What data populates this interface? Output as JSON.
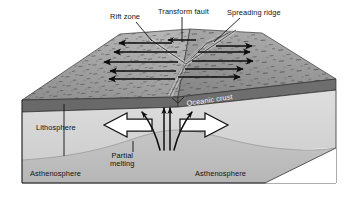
{
  "figure": {
    "type": "geological-cross-section-block-diagram",
    "width": 349,
    "height": 198,
    "background": "#ffffff"
  },
  "labels": {
    "rift_zone": "Rift zone",
    "transform_fault": "Transform fault",
    "spreading_ridge": "Spreading ridge",
    "oceanic_crust": "Oceanic crust",
    "lithosphere": "Lithosphere",
    "asthenosphere_left": "Asthenosphere",
    "asthenosphere_right": "Asthenosphere",
    "partial_melting_line1": "Partial",
    "partial_melting_line2": "melting"
  },
  "colors": {
    "background": "#ffffff",
    "top_surface_left": "#9a9a9a",
    "top_surface_right": "#8e8e8e",
    "oceanic_crust_band": "#6b6b6b",
    "crust_front_face": "#5e5e5e",
    "lithosphere_fill": "#d6d6d6",
    "asthenosphere_fill": "#c2c2c2",
    "side_face_fill": "#b9b9b9",
    "outline": "#2b2b2b",
    "arrow_solid": "#111111",
    "arrow_hollow_fill": "#ffffff",
    "label_text": "#111111",
    "label_text_on_dark": "#f2f2f2"
  },
  "features": {
    "plate_motion_arrows_left": {
      "name": "left-plate-motion-arrows",
      "direction": "west",
      "count": 5,
      "style": "solid-black-line-arrow"
    },
    "plate_motion_arrows_right": {
      "name": "right-plate-motion-arrows",
      "direction": "east",
      "count": 5,
      "style": "solid-black-line-arrow"
    },
    "divergence_arrows": {
      "name": "lithosphere-divergence-arrows",
      "count": 2,
      "style": "hollow-outline-arrow",
      "directions": [
        "west",
        "east"
      ]
    },
    "upwelling_arrows": {
      "name": "magma-upwelling-arrows",
      "count": 4,
      "style": "thin-curved-arrow",
      "direction": "upward-splaying"
    },
    "ridge_axis": {
      "name": "spreading-ridge-axis",
      "orientation": "diagonal-northeast"
    },
    "transform_fault_segment": {
      "name": "transform-fault-offset",
      "orientation": "northwest-southeast"
    }
  }
}
